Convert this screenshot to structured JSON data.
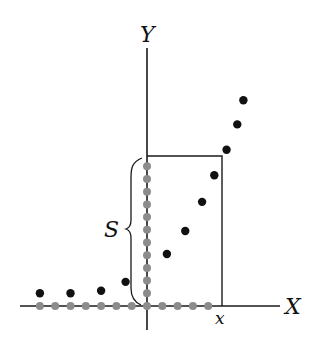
{
  "diagram": {
    "x_axis_label": "X",
    "y_axis_label": "Y",
    "x_marker_label": "x",
    "brace_label": "S",
    "colors": {
      "ink": "#1a1a1a",
      "black_point": "#111111",
      "gray_point": "#8c8c8c"
    },
    "black_points": [
      {
        "x": -7,
        "y": 1
      },
      {
        "x": -5,
        "y": 1
      },
      {
        "x": -3,
        "y": 1.2
      },
      {
        "x": -1.4,
        "y": 1.9
      },
      {
        "x": 1.3,
        "y": 4.1
      },
      {
        "x": 2.5,
        "y": 5.9
      },
      {
        "x": 3.6,
        "y": 8.2
      },
      {
        "x": 4.4,
        "y": 10.3
      },
      {
        "x": 5.2,
        "y": 12.3
      },
      {
        "x": 5.9,
        "y": 14.3
      },
      {
        "x": 6.3,
        "y": 16.2
      }
    ],
    "gray_x_points": [
      -7,
      -6,
      -5,
      -4,
      -3,
      -2,
      -1,
      0,
      1,
      2,
      3,
      4
    ],
    "gray_y_points": [
      1,
      2,
      3,
      4,
      5,
      6,
      7,
      8,
      9,
      10,
      11
    ],
    "box": {
      "x_max": 4.8,
      "y_max": 11.5
    }
  }
}
